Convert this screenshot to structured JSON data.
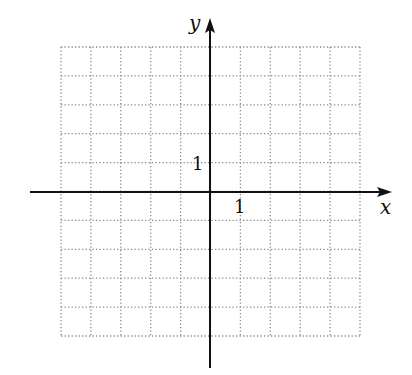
{
  "chart_data": {
    "type": "line",
    "title": "",
    "subtitle": "",
    "xlabel": "x",
    "ylabel": "y",
    "xlim": [
      -5,
      5
    ],
    "ylim": [
      -5,
      5
    ],
    "grid": true,
    "grid_style": "dotted",
    "grid_step": 1,
    "legend": null,
    "series": [],
    "annotations": [
      {
        "text": "1",
        "position": "x-axis tick at x=1",
        "x": 1,
        "y": 0
      },
      {
        "text": "1",
        "position": "y-axis tick at y=1",
        "x": 0,
        "y": 1
      }
    ],
    "tick_labels": {
      "x": [
        "1"
      ],
      "y": [
        "1"
      ]
    }
  },
  "labels": {
    "x_axis": "x",
    "y_axis": "y",
    "x_unit": "1",
    "y_unit": "1"
  },
  "colors": {
    "axis": "#111111",
    "grid": "#8a8a8a",
    "background": "#ffffff"
  }
}
